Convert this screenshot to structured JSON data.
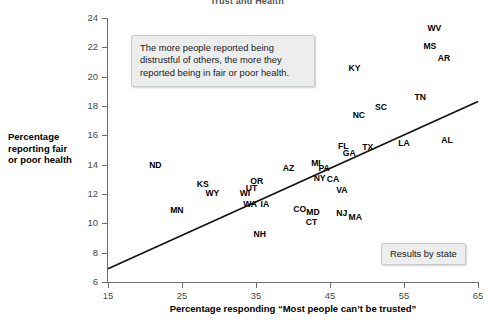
{
  "chart_data": {
    "type": "scatter",
    "title": "Trust and Health",
    "xlabel": "Percentage responding “Most people can’t be trusted”",
    "ylabel": "Percentage reporting fair or poor health",
    "xlim": [
      15,
      65
    ],
    "ylim": [
      6,
      24
    ],
    "xticks": [
      15,
      25,
      35,
      45,
      55,
      65
    ],
    "yticks": [
      6,
      8,
      10,
      12,
      14,
      16,
      18,
      20,
      22,
      24
    ],
    "grid": false,
    "legend_position": "bottom-right",
    "legend_label": "Results by state",
    "annotation": [
      "The more people reported being",
      "distrustful of others, the more they",
      "reported being in fair or poor health."
    ],
    "trendline": {
      "type": "linear",
      "x": [
        15,
        65
      ],
      "y": [
        6.9,
        18.3
      ]
    },
    "point_label_field": "state",
    "points": [
      {
        "state": "ND",
        "x": 21.4,
        "y": 14.0
      },
      {
        "state": "KS",
        "x": 27.8,
        "y": 12.7
      },
      {
        "state": "MN",
        "x": 24.3,
        "y": 10.9
      },
      {
        "state": "WY",
        "x": 29.1,
        "y": 12.1
      },
      {
        "state": "WI",
        "x": 33.5,
        "y": 12.1
      },
      {
        "state": "UT",
        "x": 34.4,
        "y": 12.4
      },
      {
        "state": "OR",
        "x": 35.1,
        "y": 12.9
      },
      {
        "state": "WA",
        "x": 34.2,
        "y": 11.3
      },
      {
        "state": "IA",
        "x": 36.2,
        "y": 11.3
      },
      {
        "state": "NH",
        "x": 35.5,
        "y": 9.3
      },
      {
        "state": "AZ",
        "x": 39.4,
        "y": 13.8
      },
      {
        "state": "MI",
        "x": 43.1,
        "y": 14.1
      },
      {
        "state": "PA",
        "x": 44.2,
        "y": 13.8
      },
      {
        "state": "NY",
        "x": 43.6,
        "y": 13.1
      },
      {
        "state": "CA",
        "x": 45.4,
        "y": 13.0
      },
      {
        "state": "CO",
        "x": 40.9,
        "y": 11.0
      },
      {
        "state": "MD",
        "x": 42.7,
        "y": 10.8
      },
      {
        "state": "CT",
        "x": 42.5,
        "y": 10.1
      },
      {
        "state": "NJ",
        "x": 46.6,
        "y": 10.7
      },
      {
        "state": "MA",
        "x": 48.4,
        "y": 10.4
      },
      {
        "state": "VA",
        "x": 46.6,
        "y": 12.3
      },
      {
        "state": "FL",
        "x": 46.8,
        "y": 15.3
      },
      {
        "state": "GA",
        "x": 47.6,
        "y": 14.8
      },
      {
        "state": "TX",
        "x": 50.1,
        "y": 15.2
      },
      {
        "state": "NC",
        "x": 48.9,
        "y": 17.4
      },
      {
        "state": "SC",
        "x": 51.9,
        "y": 17.9
      },
      {
        "state": "KY",
        "x": 48.3,
        "y": 20.6
      },
      {
        "state": "LA",
        "x": 55.0,
        "y": 15.5
      },
      {
        "state": "AL",
        "x": 60.8,
        "y": 15.7
      },
      {
        "state": "TN",
        "x": 57.2,
        "y": 18.6
      },
      {
        "state": "AR",
        "x": 60.4,
        "y": 21.3
      },
      {
        "state": "MS",
        "x": 58.5,
        "y": 22.1
      },
      {
        "state": "WV",
        "x": 59.1,
        "y": 23.3
      }
    ]
  }
}
